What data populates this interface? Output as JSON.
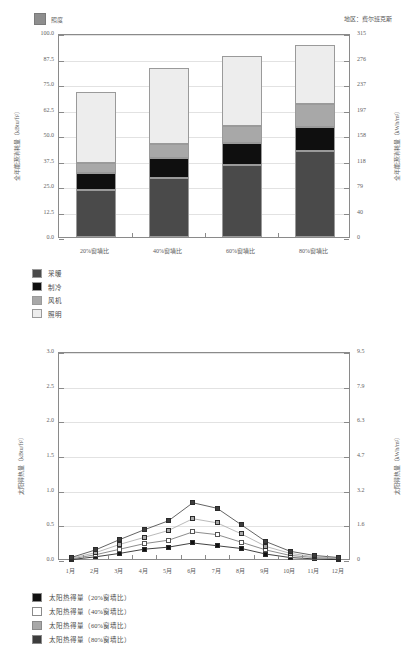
{
  "page": {
    "region_label": "地区：费尔班克斯"
  },
  "chart_data": [
    {
      "type": "bar",
      "id": "annual-energy",
      "title": "",
      "stacked": true,
      "legend_top": {
        "label": "照度",
        "color": "#8e8e8e"
      },
      "categories": [
        "20%窗墙比",
        "40%窗墙比",
        "60%窗墙比",
        "80%窗墙比"
      ],
      "series": [
        {
          "name": "采暖",
          "color": "#4a4a4a",
          "values": [
            23.0,
            29.0,
            35.5,
            42.0
          ]
        },
        {
          "name": "制冷",
          "color": "#0f0f0f",
          "values": [
            8.5,
            9.5,
            10.5,
            12.0
          ]
        },
        {
          "name": "风机",
          "color": "#a8a8a8",
          "values": [
            5.0,
            7.0,
            8.5,
            11.0
          ]
        },
        {
          "name": "照明",
          "color": "#ededed",
          "values": [
            34.5,
            37.5,
            34.0,
            29.0
          ]
        }
      ],
      "totals": [
        71.0,
        83.0,
        88.5,
        94.0
      ],
      "ylabel": "全年能源消耗量（kBtu/ft²）",
      "yticks": [
        "0.0",
        "12.5",
        "25.0",
        "37.5",
        "50.0",
        "62.5",
        "75.0",
        "87.5",
        "100.0"
      ],
      "ylim": [
        0,
        100
      ],
      "ylabel_right": "全年能源消耗量（kWh/m²）",
      "yticks_right": [
        "0",
        "40",
        "79",
        "118",
        "158",
        "197",
        "237",
        "276",
        "315"
      ],
      "ylim_right": [
        0,
        315
      ],
      "xlabel": "",
      "grid": true
    },
    {
      "type": "line",
      "id": "solar-heat-gain",
      "title": "",
      "categories": [
        "1月",
        "2月",
        "3月",
        "4月",
        "5月",
        "6月",
        "7月",
        "8月",
        "9月",
        "10月",
        "11月",
        "12月"
      ],
      "series": [
        {
          "name": "太阳热得量（20%窗墙比）",
          "color": "#111111",
          "marker": "filled-square",
          "values": [
            0.02,
            0.06,
            0.11,
            0.17,
            0.2,
            0.26,
            0.22,
            0.18,
            0.1,
            0.05,
            0.03,
            0.02
          ]
        },
        {
          "name": "太阳热得量（40%窗墙比）",
          "color": "#ffffff",
          "marker": "open-square",
          "values": [
            0.03,
            0.09,
            0.17,
            0.25,
            0.3,
            0.42,
            0.38,
            0.27,
            0.16,
            0.08,
            0.05,
            0.03
          ]
        },
        {
          "name": "太阳热得量（60%窗墙比）",
          "color": "#a8a8a8",
          "marker": "filled-square",
          "values": [
            0.04,
            0.12,
            0.24,
            0.34,
            0.44,
            0.61,
            0.55,
            0.39,
            0.21,
            0.11,
            0.06,
            0.04
          ]
        },
        {
          "name": "太阳热得量（80%窗墙比）",
          "color": "#3c3c3c",
          "marker": "filled-square",
          "values": [
            0.05,
            0.16,
            0.31,
            0.45,
            0.58,
            0.84,
            0.76,
            0.52,
            0.28,
            0.14,
            0.08,
            0.05
          ]
        }
      ],
      "ylabel": "太阳得热量（kBtu/ft²）",
      "yticks": [
        "0.0",
        "0.5",
        "1.0",
        "1.5",
        "2.0",
        "2.5",
        "3.0"
      ],
      "ylim": [
        0,
        3.0
      ],
      "ylabel_right": "太阳得热量（kWh/m²）",
      "yticks_right": [
        "0",
        "1.6",
        "3.2",
        "4.7",
        "6.3",
        "7.9",
        "9.5"
      ],
      "ylim_right": [
        0,
        9.5
      ],
      "xlabel": "",
      "grid": true
    }
  ]
}
